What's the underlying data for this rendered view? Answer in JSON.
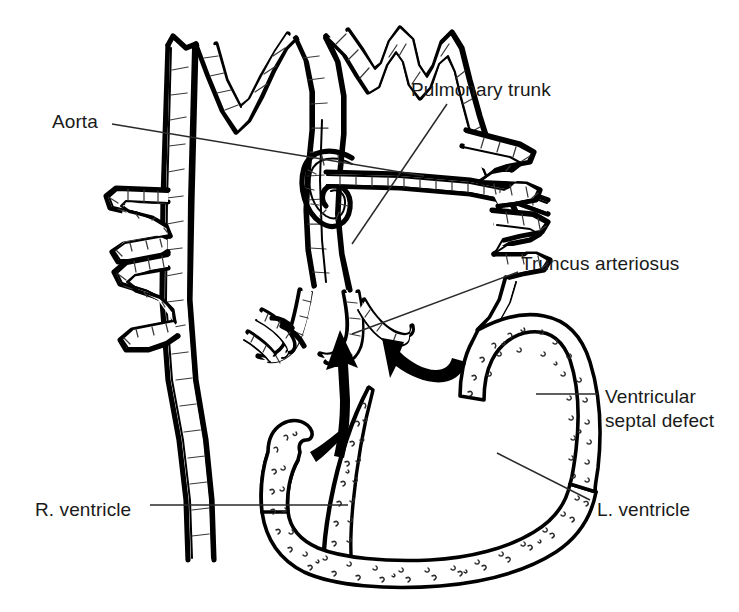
{
  "figure": {
    "background_color": "#ffffff",
    "line_color": "#000000",
    "text_color": "#1a1a1a",
    "width": 739,
    "height": 612
  },
  "labels": [
    {
      "id": "aorta",
      "text": "Aorta",
      "x": 52,
      "y": 110
    },
    {
      "id": "pulmonary-trunk",
      "text": "Pulmonary trunk",
      "x": 411,
      "y": 78
    },
    {
      "id": "truncus-arteriosus",
      "text": "Truncus arteriosus",
      "x": 521,
      "y": 252
    },
    {
      "id": "ventricular-septal-defect-line1",
      "text": "Ventricular",
      "x": 605,
      "y": 385
    },
    {
      "id": "ventricular-septal-defect-line2",
      "text": "septal defect",
      "x": 605,
      "y": 409
    },
    {
      "id": "r-ventricle",
      "text": "R. ventricle",
      "x": 35,
      "y": 498
    },
    {
      "id": "l-ventricle",
      "text": "L. ventricle",
      "x": 597,
      "y": 498
    }
  ],
  "leaders": [
    {
      "id": "leader-aorta",
      "from": [
        112,
        124
      ],
      "to": [
        424,
        176
      ]
    },
    {
      "id": "leader-pulmonary-trunk",
      "from": [
        447,
        104
      ],
      "to": [
        352,
        244
      ]
    },
    {
      "id": "leader-truncus-arteriosus",
      "from": [
        518,
        272
      ],
      "to": [
        352,
        334
      ]
    },
    {
      "id": "leader-vsd",
      "from": [
        598,
        394
      ],
      "to": [
        536,
        394
      ]
    },
    {
      "id": "leader-r-ventricle",
      "from": [
        150,
        505
      ],
      "to": [
        348,
        505
      ]
    },
    {
      "id": "leader-l-ventricle",
      "from": [
        590,
        500
      ],
      "to": [
        497,
        453
      ]
    }
  ],
  "flow_arrows": [
    {
      "id": "arrow-right-ventricle-shunt",
      "description": "bold arrow ascending from right ventricle into truncus"
    },
    {
      "id": "arrow-left-ventricle-shunt",
      "description": "bold curved arrow from left ventricle through septal defect into truncus"
    }
  ],
  "structures": [
    {
      "id": "aorta-ascending",
      "name": "Aorta"
    },
    {
      "id": "pulmonary-trunk",
      "name": "Pulmonary trunk"
    },
    {
      "id": "truncus-arteriosus",
      "name": "Truncus arteriosus"
    },
    {
      "id": "truncal-valve",
      "name": "Truncal valve cusps"
    },
    {
      "id": "ventricular-septal-defect",
      "name": "Ventricular septal defect"
    },
    {
      "id": "right-ventricle",
      "name": "R. ventricle"
    },
    {
      "id": "left-ventricle",
      "name": "L. ventricle"
    },
    {
      "id": "interventricular-septum",
      "name": "Interventricular septum"
    },
    {
      "id": "pulmonary-branches-left",
      "name": "Left pulmonary branches"
    },
    {
      "id": "pulmonary-branches-right",
      "name": "Right pulmonary branches"
    }
  ]
}
